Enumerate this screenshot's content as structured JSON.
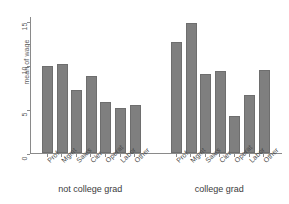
{
  "chart_data": {
    "type": "bar",
    "title": "",
    "subtitle": "",
    "xlabel": "",
    "ylabel": "mean of wage",
    "ylim": [
      0,
      15
    ],
    "yticks": [
      0,
      5,
      10,
      15
    ],
    "ytick_labels": [
      "0",
      "5",
      "10",
      "15"
    ],
    "grid": false,
    "legend": null,
    "categories": [
      "Prof",
      "Mgmt",
      "Sales",
      "Cler",
      "Operat",
      "Labor",
      "Other"
    ],
    "groups": [
      {
        "name": "not college grad",
        "label": "not college grad",
        "values": [
          9.5,
          9.7,
          6.9,
          8.4,
          5.6,
          4.9,
          5.3
        ]
      },
      {
        "name": "college grad",
        "label": "college grad",
        "values": [
          12.2,
          14.2,
          8.7,
          9.0,
          4.1,
          6.3,
          9.1
        ]
      }
    ],
    "bar_color": "#7f7f7f",
    "axis_color": "#8a8a8a",
    "background": "#ffffff"
  }
}
